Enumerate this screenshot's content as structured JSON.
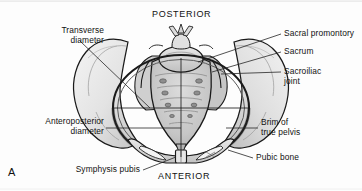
{
  "figure": {
    "label": "A",
    "caption_absent": true
  },
  "orientation": {
    "top": "POSTERIOR",
    "bottom": "ANTERIOR"
  },
  "labels": {
    "transverse_diameter": "Transverse\ndiameter",
    "anteroposterior_diameter": "Anteroposterior\ndiameter",
    "symphysis_pubis": "Symphysis pubis",
    "sacral_promontory": "Sacral promontory",
    "sacrum": "Sacrum",
    "sacroiliac_joint": "Sacroiliac\njoint",
    "brim_of_true_pelvis": "Brim of\ntrue pelvis",
    "pubic_bone": "Pubic bone"
  },
  "colors": {
    "outline": "#1a1a1a",
    "leader_line": "#2a2a2a",
    "bone_light": "#f0f0f0",
    "bone_mid": "#d8d8d8",
    "bone_shadow": "#b9b9b9",
    "sacrum_fill": "#c9c9c9",
    "foramen": "#8e8e8e",
    "text": "#121212",
    "background": "#fdfdfd"
  },
  "structures": [
    "right ilium",
    "left ilium",
    "sacrum",
    "sacral promontory",
    "sacral foramina",
    "coccyx",
    "sacroiliac joint",
    "pelvic brim",
    "pubic bone",
    "symphysis pubis",
    "obturator foramen"
  ],
  "measurement_lines": [
    {
      "name": "transverse-diameter-line",
      "orientation": "horizontal"
    },
    {
      "name": "anteroposterior-diameter-line",
      "orientation": "vertical"
    }
  ]
}
